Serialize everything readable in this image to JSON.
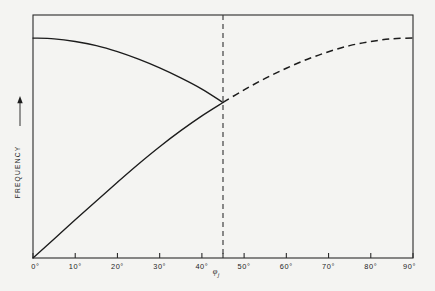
{
  "figure": {
    "background_color": "#f4f4f2",
    "line_color": "#1c1c1c"
  },
  "chart_data": {
    "type": "line",
    "title": "",
    "xlabel": "φ",
    "xlabel_subscript": "j",
    "ylabel": "FREQUENCY",
    "ylabel_arrow": "→",
    "xlim": [
      0,
      90
    ],
    "ylim": [
      0,
      1
    ],
    "grid": false,
    "legend": false,
    "x_tick_labels": [
      "0°",
      "10°",
      "20°",
      "30°",
      "40°",
      "50°",
      "60°",
      "70°",
      "80°",
      "90°"
    ],
    "x_tick_values": [
      0,
      10,
      20,
      30,
      40,
      50,
      60,
      70,
      80,
      90
    ],
    "extra_tick_values": [
      45
    ],
    "y_tick_labels": [],
    "annotations": [
      {
        "name": "crossing-marker",
        "type": "vertical-dashed-line",
        "x": 45,
        "label": ""
      }
    ],
    "series": [
      {
        "name": "descending-curve",
        "style": "solid",
        "x": [
          0,
          5,
          10,
          15,
          20,
          25,
          30,
          35,
          40,
          45
        ],
        "y": [
          0.905,
          0.902,
          0.891,
          0.874,
          0.849,
          0.818,
          0.782,
          0.741,
          0.695,
          0.64
        ]
      },
      {
        "name": "ascending-curve-solid",
        "style": "solid",
        "x": [
          0,
          5,
          10,
          15,
          20,
          25,
          30,
          35,
          40,
          45
        ],
        "y": [
          0.0,
          0.078,
          0.157,
          0.235,
          0.312,
          0.387,
          0.458,
          0.524,
          0.585,
          0.64
        ]
      },
      {
        "name": "ascending-curve-dashed",
        "style": "dashed",
        "x": [
          45,
          50,
          55,
          60,
          65,
          70,
          75,
          80,
          85,
          90
        ],
        "y": [
          0.64,
          0.692,
          0.739,
          0.781,
          0.818,
          0.849,
          0.874,
          0.891,
          0.902,
          0.905
        ]
      }
    ]
  }
}
